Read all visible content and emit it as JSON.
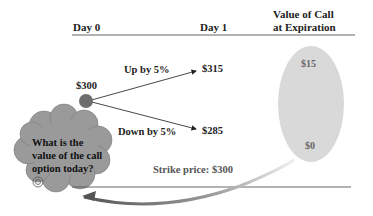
{
  "header": {
    "day0": "Day 0",
    "day1": "Day 1",
    "value_line1": "Value of Call",
    "value_line2": "at Expiration"
  },
  "tree": {
    "start_price": "$300",
    "up_label": "Up by 5%",
    "up_price": "$315",
    "down_label": "Down by 5%",
    "down_price": "$285"
  },
  "payoffs": {
    "up_value": "$15",
    "down_value": "$0"
  },
  "strike": "Strike price: $300",
  "question": {
    "line1": "What is the",
    "line2": "value of the call",
    "line3": "option today?"
  },
  "colors": {
    "node": "#6e6e6e",
    "cloud": "#9a9a9a",
    "ellipse": "#d8d8d8",
    "rule": "#555555"
  }
}
